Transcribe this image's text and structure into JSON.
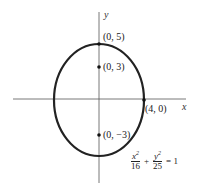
{
  "diagram": {
    "axes": {
      "x_label": "x",
      "y_label": "y"
    },
    "ellipse": {
      "a": 4,
      "b": 5,
      "center": [
        0,
        0
      ]
    },
    "points": [
      {
        "label": "(0, 5)",
        "role": "vertex"
      },
      {
        "label": "(0, 3)",
        "role": "focus"
      },
      {
        "label": "(4, 0)",
        "role": "co-vertex"
      },
      {
        "label": "(0, −3)",
        "role": "focus"
      }
    ],
    "equation": {
      "term1_num": "x",
      "term1_exp": "2",
      "term1_den": "16",
      "plus": "+",
      "term2_num": "y",
      "term2_exp": "2",
      "term2_den": "25",
      "equals": "= 1"
    },
    "colors": {
      "curve": "#222222",
      "axis": "#555555"
    }
  }
}
